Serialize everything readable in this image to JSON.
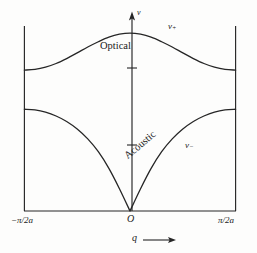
{
  "figure": {
    "axis_y_label": "ν",
    "axis_x_label": "q",
    "axis_x_arrow": "⟶",
    "origin_label": "O",
    "x_min_label": "−π/2a",
    "x_max_label": "π/2a",
    "branch_optical_label": "Optical",
    "branch_acoustic_label": "Acoustic",
    "curve_upper_label": "ν",
    "curve_upper_sub": "+",
    "curve_lower_label": "ν",
    "curve_lower_sub": "−",
    "line_color": "#262626",
    "background_color": "#fdfdfc"
  },
  "chart_data": {
    "type": "line",
    "xlabel": "q",
    "ylabel": "ν",
    "xlim": [
      -1,
      1
    ],
    "ylim": [
      0,
      1
    ],
    "xtick_labels": [
      "−π/2a",
      "O",
      "π/2a"
    ],
    "xtick_values": [
      -1,
      0,
      1
    ],
    "ytick_labels": [
      "",
      ""
    ],
    "ytick_values": [
      0.33,
      0.77
    ],
    "grid": false,
    "legend": "inline-annotations",
    "annotations": [
      {
        "text": "Optical",
        "x": -0.14,
        "y": 0.855
      },
      {
        "text": "ν₊",
        "x": 0.38,
        "y": 0.94
      },
      {
        "text": "Acoustic",
        "x": -0.05,
        "y": 0.29,
        "rotation": -40
      },
      {
        "text": "ν₋",
        "x": 0.5,
        "y": 0.33
      }
    ],
    "series": [
      {
        "name": "ν₊",
        "branch": "optical",
        "x": [
          -1.0,
          -0.9,
          -0.8,
          -0.7,
          -0.6,
          -0.5,
          -0.4,
          -0.3,
          -0.2,
          -0.1,
          0.0,
          0.1,
          0.2,
          0.3,
          0.4,
          0.5,
          0.6,
          0.7,
          0.8,
          0.9,
          1.0
        ],
        "y": [
          0.77,
          0.774,
          0.786,
          0.806,
          0.833,
          0.864,
          0.896,
          0.925,
          0.95,
          0.966,
          0.972,
          0.966,
          0.95,
          0.925,
          0.896,
          0.864,
          0.833,
          0.806,
          0.786,
          0.774,
          0.77
        ]
      },
      {
        "name": "ν₋",
        "branch": "acoustic",
        "x": [
          -1.0,
          -0.9,
          -0.8,
          -0.7,
          -0.6,
          -0.5,
          -0.4,
          -0.3,
          -0.2,
          -0.1,
          0.0,
          0.1,
          0.2,
          0.3,
          0.4,
          0.5,
          0.6,
          0.7,
          0.8,
          0.9,
          1.0
        ],
        "y": [
          0.556,
          0.552,
          0.54,
          0.519,
          0.489,
          0.448,
          0.394,
          0.324,
          0.233,
          0.122,
          0.0,
          0.122,
          0.233,
          0.324,
          0.394,
          0.448,
          0.489,
          0.519,
          0.54,
          0.552,
          0.556
        ]
      }
    ]
  }
}
